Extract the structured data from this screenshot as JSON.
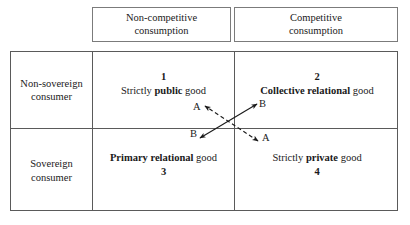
{
  "figure": {
    "type": "2x2-matrix-diagram",
    "column_headers": [
      {
        "id": "non-competitive",
        "line1": "Non-competitive",
        "line2": "consumption"
      },
      {
        "id": "competitive",
        "line1": "Competitive",
        "line2": "consumption"
      }
    ],
    "row_headers": [
      {
        "id": "non-sovereign",
        "line1": "Non-sovereign",
        "line2": "consumer"
      },
      {
        "id": "sovereign",
        "line1": "Sovereign",
        "line2": "consumer"
      }
    ],
    "quadrants": [
      {
        "id": "quadrant-1",
        "number": "1",
        "number_position": "above",
        "prefix": "Strictly ",
        "emphasis": "public",
        "suffix": " good",
        "row": "non-sovereign",
        "column": "non-competitive"
      },
      {
        "id": "quadrant-2",
        "number": "2",
        "number_position": "above",
        "prefix": "",
        "emphasis": "Collective relational",
        "suffix": " good",
        "row": "non-sovereign",
        "column": "competitive"
      },
      {
        "id": "quadrant-3",
        "number": "3",
        "number_position": "below",
        "prefix": "",
        "emphasis": "Primary relational",
        "suffix": " good",
        "row": "sovereign",
        "column": "non-competitive"
      },
      {
        "id": "quadrant-4",
        "number": "4",
        "number_position": "below",
        "prefix": "Strictly ",
        "emphasis": "private",
        "suffix": " good",
        "row": "sovereign",
        "column": "competitive"
      }
    ],
    "arrows": [
      {
        "id": "arrow-a",
        "label": "A",
        "style": "dashed",
        "heads": "both",
        "orientation": "northwest-southeast",
        "from_quadrant": "2",
        "to_quadrant": "3"
      },
      {
        "id": "arrow-b",
        "label": "B",
        "style": "solid",
        "heads": "both",
        "orientation": "southwest-northeast",
        "from_quadrant": "3",
        "to_quadrant": "2"
      }
    ],
    "arrow_labels": [
      {
        "id": "a-top",
        "text": "A"
      },
      {
        "id": "b-top",
        "text": "B"
      },
      {
        "id": "b-bottom",
        "text": "B"
      },
      {
        "id": "a-bottom",
        "text": "A"
      }
    ],
    "colors": {
      "line": "#5a5a5a",
      "header_border": "#7b7b7b",
      "text": "#1a1a1a",
      "background": "#ffffff"
    }
  }
}
